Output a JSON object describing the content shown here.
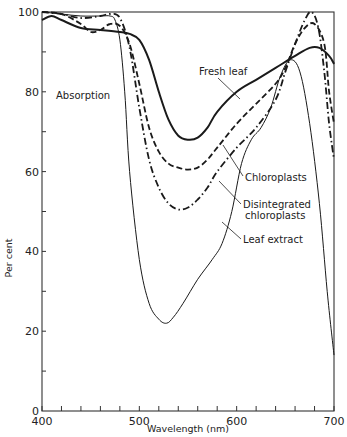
{
  "chart_data": {
    "type": "line",
    "title": "",
    "xlabel": "Wavelength (nm)",
    "ylabel": "Per cent",
    "xlim": [
      400,
      700
    ],
    "ylim": [
      0,
      100
    ],
    "grid": false,
    "x_ticks": [
      400,
      500,
      600,
      700
    ],
    "y_ticks": [
      0,
      20,
      40,
      60,
      80,
      100
    ],
    "x_minor_step": 20,
    "y_minor_step": 10,
    "annotations": [
      {
        "id": "absorption",
        "text": "Absorption"
      },
      {
        "id": "fresh",
        "text": "Fresh leaf"
      },
      {
        "id": "chloro",
        "text": "Chloroplasts"
      },
      {
        "id": "disint1",
        "text": "Disintegrated"
      },
      {
        "id": "disint2",
        "text": "chloroplasts"
      },
      {
        "id": "extract",
        "text": "Leaf extract"
      }
    ],
    "series": [
      {
        "name": "Fresh leaf",
        "style": "solid-thick",
        "points": [
          [
            400,
            98
          ],
          [
            410,
            99
          ],
          [
            420,
            98
          ],
          [
            440,
            96
          ],
          [
            460,
            95.5
          ],
          [
            480,
            95
          ],
          [
            490,
            94.5
          ],
          [
            500,
            93
          ],
          [
            510,
            88
          ],
          [
            520,
            80
          ],
          [
            530,
            73
          ],
          [
            540,
            69
          ],
          [
            550,
            68
          ],
          [
            560,
            68.5
          ],
          [
            570,
            71
          ],
          [
            580,
            75
          ],
          [
            600,
            80
          ],
          [
            620,
            83
          ],
          [
            640,
            86
          ],
          [
            660,
            89
          ],
          [
            675,
            91
          ],
          [
            685,
            91
          ],
          [
            695,
            89
          ],
          [
            700,
            87
          ]
        ]
      },
      {
        "name": "Chloroplasts",
        "style": "dashed",
        "points": [
          [
            400,
            100
          ],
          [
            420,
            99.5
          ],
          [
            440,
            97
          ],
          [
            450,
            95
          ],
          [
            460,
            95.5
          ],
          [
            470,
            97
          ],
          [
            480,
            96.5
          ],
          [
            490,
            92
          ],
          [
            500,
            82
          ],
          [
            510,
            71
          ],
          [
            520,
            65
          ],
          [
            530,
            62
          ],
          [
            540,
            61
          ],
          [
            550,
            60.5
          ],
          [
            560,
            61
          ],
          [
            570,
            63
          ],
          [
            580,
            66
          ],
          [
            600,
            72
          ],
          [
            620,
            77
          ],
          [
            640,
            82
          ],
          [
            650,
            86
          ],
          [
            660,
            92
          ],
          [
            670,
            96
          ],
          [
            680,
            97
          ],
          [
            690,
            92
          ],
          [
            695,
            80
          ],
          [
            700,
            72
          ]
        ]
      },
      {
        "name": "Disintegrated chloroplasts",
        "style": "dash-dot",
        "points": [
          [
            400,
            100
          ],
          [
            420,
            99.5
          ],
          [
            440,
            98.5
          ],
          [
            460,
            99
          ],
          [
            470,
            99.5
          ],
          [
            480,
            98.5
          ],
          [
            490,
            91
          ],
          [
            500,
            76
          ],
          [
            510,
            63
          ],
          [
            520,
            56
          ],
          [
            530,
            52
          ],
          [
            540,
            50.5
          ],
          [
            550,
            51
          ],
          [
            560,
            53
          ],
          [
            570,
            56
          ],
          [
            580,
            60
          ],
          [
            600,
            66
          ],
          [
            620,
            71
          ],
          [
            640,
            78
          ],
          [
            650,
            85
          ],
          [
            660,
            92
          ],
          [
            670,
            98
          ],
          [
            677,
            100
          ],
          [
            684,
            96
          ],
          [
            690,
            85
          ],
          [
            695,
            72
          ],
          [
            700,
            63
          ]
        ]
      },
      {
        "name": "Leaf extract",
        "style": "solid-thin",
        "points": [
          [
            400,
            100
          ],
          [
            420,
            99.5
          ],
          [
            440,
            99
          ],
          [
            460,
            99
          ],
          [
            470,
            99
          ],
          [
            475,
            98
          ],
          [
            480,
            93
          ],
          [
            485,
            80
          ],
          [
            490,
            60
          ],
          [
            500,
            38
          ],
          [
            510,
            27
          ],
          [
            520,
            23
          ],
          [
            528,
            22
          ],
          [
            535,
            23.5
          ],
          [
            545,
            27
          ],
          [
            560,
            33
          ],
          [
            575,
            38
          ],
          [
            585,
            42
          ],
          [
            595,
            50
          ],
          [
            605,
            62
          ],
          [
            615,
            68
          ],
          [
            625,
            71
          ],
          [
            635,
            76
          ],
          [
            645,
            84
          ],
          [
            655,
            88
          ],
          [
            665,
            85
          ],
          [
            675,
            72
          ],
          [
            685,
            52
          ],
          [
            693,
            30
          ],
          [
            700,
            14
          ]
        ]
      }
    ]
  }
}
